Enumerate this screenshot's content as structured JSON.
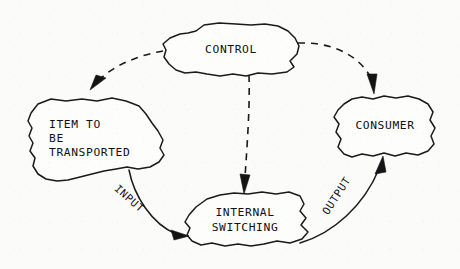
{
  "diagram": {
    "type": "block-flow-diagram",
    "style": "hand-drawn freeform blobs, scanned line art",
    "background_color": "#fbfbfa",
    "line_color": "#1a1a1a",
    "nodes": [
      {
        "id": "control",
        "label": "CONTROL",
        "lines": [
          "CONTROL"
        ],
        "position": "top-center"
      },
      {
        "id": "item",
        "label": "ITEM TO BE TRANSPORTED",
        "lines": [
          "ITEM TO",
          "BE",
          "TRANSPORTED"
        ],
        "position": "left"
      },
      {
        "id": "consumer",
        "label": "CONSUMER",
        "lines": [
          "CONSUMER"
        ],
        "position": "right"
      },
      {
        "id": "switching",
        "label": "INTERNAL SWITCHING",
        "lines": [
          "INTERNAL",
          "SWITCHING"
        ],
        "position": "bottom-center"
      }
    ],
    "edges": [
      {
        "id": "input",
        "label": "INPUT",
        "from": "item",
        "to": "switching",
        "style": "solid",
        "arrow": "end"
      },
      {
        "id": "output",
        "label": "OUTPUT",
        "from": "switching",
        "to": "consumer",
        "style": "solid",
        "arrow": "end"
      },
      {
        "id": "control-to-item",
        "label": "",
        "from": "control",
        "to": "item",
        "style": "dashed",
        "arrow": "end"
      },
      {
        "id": "control-to-switching",
        "label": "",
        "from": "control",
        "to": "switching",
        "style": "dashed",
        "arrow": "end"
      },
      {
        "id": "control-to-consumer",
        "label": "",
        "from": "control",
        "to": "consumer",
        "style": "dashed",
        "arrow": "end"
      }
    ]
  }
}
